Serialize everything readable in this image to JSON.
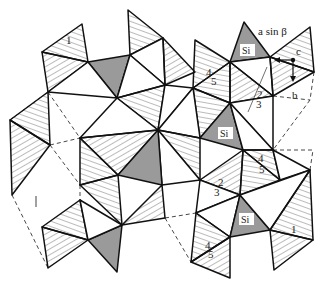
{
  "figure": {
    "colors": {
      "line": "#111111",
      "hatch": "#555555",
      "si_fill": "#9a9a9a",
      "dashed": "#333333",
      "background": "#ffffff"
    },
    "labels": {
      "si_1": "Si",
      "si_2": "Si",
      "si_3": "Si",
      "axis_a": "a  sin β",
      "axis_b": "b",
      "axis_c": "c",
      "n2_top": "2",
      "n3_top": "3",
      "n4_top": "4",
      "n5_top": "5",
      "n2_mid": "2",
      "n3_mid": "3",
      "n4_mid": "4",
      "n5_mid": "5",
      "n4_bot": "4",
      "n5_bot": "5",
      "n1_top": "1",
      "n1_bot": "1",
      "n1_left": "1"
    }
  }
}
